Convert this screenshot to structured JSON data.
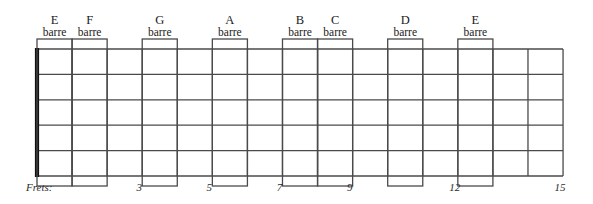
{
  "diagram": {
    "frets_caption": "Frets:",
    "fret_count": 15,
    "string_count": 6,
    "colors": {
      "background": "#ffffff",
      "grid_line": "#4a4a4a",
      "nut": "#111111",
      "barre_box": "#4a4a4a",
      "text": "#1a1a1a"
    },
    "geometry": {
      "nut_x": 37,
      "board_right_x": 563,
      "board_top_y": 49,
      "board_bottom_y": 176,
      "fret_spacing": 35.07,
      "barre_box_top_y": 39,
      "barre_box_bottom_y": 186
    },
    "barre_label_word": "barre",
    "barres": [
      {
        "note": "E",
        "barre": "barre",
        "fret": 1
      },
      {
        "note": "F",
        "barre": "barre",
        "fret": 2
      },
      {
        "note": "G",
        "barre": "barre",
        "fret": 4
      },
      {
        "note": "A",
        "barre": "barre",
        "fret": 6
      },
      {
        "note": "B",
        "barre": "barre",
        "fret": 8
      },
      {
        "note": "C",
        "barre": "barre",
        "fret": 9
      },
      {
        "note": "D",
        "barre": "barre",
        "fret": 11
      },
      {
        "note": "E",
        "barre": "barre",
        "fret": 13
      }
    ],
    "fret_markers": [
      {
        "label": "3",
        "fret": 3
      },
      {
        "label": "5",
        "fret": 5
      },
      {
        "label": "7",
        "fret": 7
      },
      {
        "label": "9",
        "fret": 9
      },
      {
        "label": "12",
        "fret": 12
      },
      {
        "label": "15",
        "fret": 15
      }
    ]
  }
}
